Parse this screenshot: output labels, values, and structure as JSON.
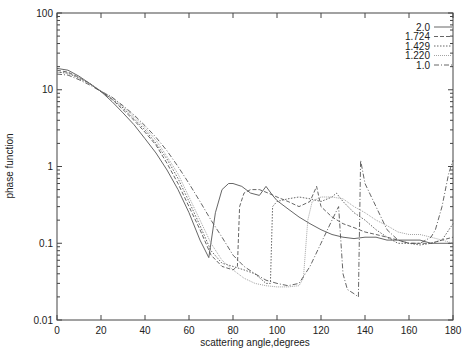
{
  "chart_data": {
    "type": "line",
    "title": "",
    "xlabel": "scattering angle,degrees",
    "ylabel": "phase function",
    "xlim": [
      0,
      180
    ],
    "ylim": [
      0.01,
      100
    ],
    "yscale": "log",
    "grid": false,
    "legend_position": "top-right",
    "x_ticks": [
      "0",
      "20",
      "40",
      "60",
      "80",
      "100",
      "120",
      "140",
      "160",
      "180"
    ],
    "y_ticks": [
      "0.01",
      "0.1",
      "1",
      "10",
      "100"
    ],
    "series": [
      {
        "name": "2.0",
        "style": "solid",
        "color": "#555555",
        "x": [
          0,
          5,
          10,
          15,
          20,
          25,
          30,
          35,
          40,
          45,
          50,
          55,
          60,
          65,
          69,
          72,
          75,
          78,
          80,
          84,
          88,
          92,
          95,
          98,
          100,
          105,
          110,
          115,
          120,
          125,
          130,
          135,
          140,
          145,
          150,
          155,
          160,
          165,
          170,
          175,
          180
        ],
        "values": [
          19,
          18,
          15,
          12,
          9.5,
          7,
          5,
          3.5,
          2.3,
          1.5,
          0.9,
          0.5,
          0.25,
          0.11,
          0.065,
          0.25,
          0.5,
          0.6,
          0.6,
          0.55,
          0.45,
          0.42,
          0.55,
          0.42,
          0.36,
          0.28,
          0.22,
          0.18,
          0.15,
          0.13,
          0.12,
          0.115,
          0.12,
          0.12,
          0.11,
          0.11,
          0.11,
          0.11,
          0.1,
          0.1,
          0.1
        ]
      },
      {
        "name": "1.724",
        "style": "dashed",
        "color": "#555555",
        "x": [
          0,
          5,
          10,
          15,
          20,
          25,
          30,
          35,
          40,
          45,
          50,
          55,
          60,
          65,
          70,
          75,
          80,
          82,
          83,
          85,
          88,
          92,
          96,
          100,
          105,
          110,
          115,
          118,
          120,
          125,
          130,
          135,
          140,
          145,
          150,
          155,
          160,
          165,
          170,
          175,
          180
        ],
        "values": [
          18,
          17,
          14.5,
          12,
          9.5,
          7.5,
          5.5,
          4,
          2.8,
          1.9,
          1.1,
          0.6,
          0.3,
          0.15,
          0.07,
          0.05,
          0.045,
          0.05,
          0.3,
          0.45,
          0.5,
          0.5,
          0.45,
          0.4,
          0.35,
          0.3,
          0.35,
          0.55,
          0.3,
          0.22,
          0.18,
          0.16,
          0.14,
          0.13,
          0.12,
          0.11,
          0.1,
          0.1,
          0.1,
          0.11,
          0.12
        ]
      },
      {
        "name": "1.429",
        "style": "dotted",
        "color": "#555555",
        "x": [
          0,
          5,
          10,
          15,
          20,
          25,
          30,
          35,
          40,
          45,
          50,
          55,
          60,
          65,
          70,
          75,
          80,
          85,
          90,
          95,
          97,
          98,
          100,
          105,
          110,
          115,
          120,
          125,
          127,
          130,
          135,
          140,
          145,
          150,
          155,
          160,
          165,
          170,
          175,
          180
        ],
        "values": [
          17,
          16.5,
          14,
          12,
          9.5,
          7.6,
          5.8,
          4.2,
          3,
          2,
          1.25,
          0.7,
          0.35,
          0.17,
          0.08,
          0.055,
          0.05,
          0.045,
          0.04,
          0.03,
          0.03,
          0.3,
          0.35,
          0.38,
          0.4,
          0.38,
          0.35,
          0.4,
          0.45,
          0.35,
          0.25,
          0.2,
          0.15,
          0.12,
          0.1,
          0.1,
          0.095,
          0.1,
          0.11,
          0.18
        ]
      },
      {
        "name": "1.220",
        "style": "fine-dotted",
        "color": "#999999",
        "x": [
          0,
          5,
          10,
          15,
          20,
          25,
          30,
          35,
          40,
          45,
          50,
          55,
          60,
          65,
          70,
          75,
          80,
          85,
          90,
          95,
          100,
          105,
          110,
          112,
          114,
          116,
          120,
          125,
          130,
          135,
          140,
          145,
          150,
          155,
          160,
          165,
          170,
          175,
          180
        ],
        "values": [
          17,
          16.5,
          14.5,
          12,
          9.7,
          8,
          6,
          4.5,
          3.2,
          2.2,
          1.35,
          0.8,
          0.4,
          0.2,
          0.1,
          0.06,
          0.045,
          0.035,
          0.03,
          0.028,
          0.027,
          0.027,
          0.028,
          0.035,
          0.2,
          0.35,
          0.4,
          0.4,
          0.38,
          0.3,
          0.25,
          0.2,
          0.17,
          0.14,
          0.13,
          0.13,
          0.12,
          0.11,
          0.1
        ]
      },
      {
        "name": "1.0",
        "style": "dash-dot",
        "color": "#555555",
        "x": [
          0,
          5,
          10,
          15,
          20,
          25,
          30,
          35,
          40,
          45,
          50,
          55,
          60,
          65,
          70,
          75,
          80,
          85,
          90,
          95,
          100,
          105,
          110,
          115,
          120,
          125,
          128,
          130,
          132,
          135,
          137,
          138,
          140,
          145,
          150,
          155,
          160,
          165,
          170,
          172,
          175,
          178,
          180
        ],
        "values": [
          16,
          15.5,
          13.5,
          11.5,
          9.5,
          8,
          6.2,
          4.7,
          3.4,
          2.4,
          1.6,
          1,
          0.6,
          0.35,
          0.2,
          0.12,
          0.07,
          0.05,
          0.04,
          0.033,
          0.03,
          0.028,
          0.03,
          0.05,
          0.1,
          0.2,
          0.3,
          0.04,
          0.025,
          0.022,
          0.02,
          1.2,
          0.6,
          0.3,
          0.15,
          0.11,
          0.1,
          0.1,
          0.12,
          0.15,
          0.3,
          0.8,
          1.2
        ]
      }
    ]
  },
  "legend": {
    "entries": [
      "2.0",
      "1.724",
      "1.429",
      "1.220",
      "1.0"
    ]
  },
  "axes": {
    "xlabel": "scattering angle,degrees",
    "ylabel": "phase function",
    "x_ticks": [
      "0",
      "20",
      "40",
      "60",
      "80",
      "100",
      "120",
      "140",
      "160",
      "180"
    ],
    "y_ticks": [
      "0.01",
      "0.1",
      "1",
      "10",
      "100"
    ]
  }
}
